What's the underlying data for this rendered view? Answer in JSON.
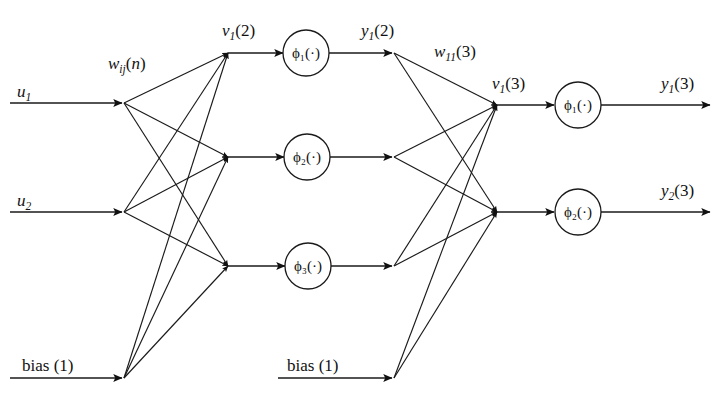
{
  "diagram": {
    "type": "neural-network-signal-flow-graph",
    "background_color": "#ffffff",
    "line_color": "#1a1a1a",
    "text_color": "#111111"
  },
  "labels": {
    "input_1": "u₁",
    "input_2": "u₂",
    "bias_layer1": "bias (1)",
    "bias_layer2": "bias (1)",
    "weight_hidden": "wᵢⱼ(n)",
    "weight_output": "w₁₁(3)",
    "v1_layer2": "v₁(2)",
    "y1_layer2": "y₁(2)",
    "v1_layer3": "v₁(3)",
    "y1_layer3": "y₁(3)",
    "y2_layer3": "y₂(3)",
    "phi1_hidden": "ϕ₁(·)",
    "phi2_hidden": "ϕ₂(·)",
    "phi3_hidden": "ϕ₃(·)",
    "phi1_output": "ϕ₁(·)",
    "phi2_output": "ϕ₂(·)"
  },
  "layers": [
    {
      "name": "input-layer",
      "index": 1,
      "nodes": [
        "u1",
        "u2",
        "bias(1)"
      ]
    },
    {
      "name": "hidden-layer",
      "index": 2,
      "activations": [
        "ϕ₁(·)",
        "ϕ₂(·)",
        "ϕ₃(·)"
      ],
      "bias": "bias (1)"
    },
    {
      "name": "output-layer",
      "index": 3,
      "activations": [
        "ϕ₁(·)",
        "ϕ₂(·)"
      ],
      "outputs": [
        "y₁(3)",
        "y₂(3)"
      ]
    }
  ],
  "geometry": {
    "width": 718,
    "height": 397,
    "input_rows_y": [
      103,
      212,
      378
    ],
    "hidden_rows_y": [
      53,
      157,
      266
    ],
    "output_rows_y": [
      105,
      212
    ],
    "fan_in_x": 122,
    "hidden_junction_x": 228,
    "hidden_circle_cx": 306,
    "hidden_fan_x": 392,
    "output_junction_x": 497,
    "output_circle_cx": 578,
    "output_arrow_end_x": 708,
    "circle_radius": 23,
    "bias2_y": 378,
    "bias2_fan_x": 392
  }
}
